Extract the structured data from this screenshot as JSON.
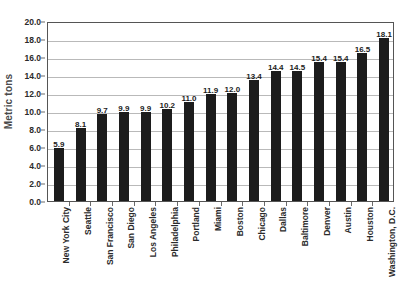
{
  "chart_data": {
    "type": "bar",
    "title": "",
    "xlabel": "",
    "ylabel": "Metric tons",
    "ylim": [
      0.0,
      20.0
    ],
    "ytick_step": 2.0,
    "ytick_labels": [
      "0.0",
      "2.0",
      "4.0",
      "6.0",
      "8.0",
      "10.0",
      "12.0",
      "14.0",
      "16.0",
      "18.0",
      "20.0"
    ],
    "grid": "horizontal",
    "legend": "none",
    "bar_color": "#1c1c1c",
    "gridline_color": "#b9b9b9",
    "axis_color": "#555555",
    "categories": [
      "New York City",
      "Seattle",
      "San Francisco",
      "San Diego",
      "Los Angeles",
      "Philadelphia",
      "Portland",
      "Miami",
      "Boston",
      "Chicago",
      "Dallas",
      "Baltimore",
      "Denver",
      "Austin",
      "Houston",
      "Washington, D.C."
    ],
    "values": [
      5.9,
      8.1,
      9.7,
      9.9,
      9.9,
      10.2,
      11.0,
      11.9,
      12.0,
      13.4,
      14.4,
      14.5,
      15.4,
      15.4,
      16.5,
      18.1
    ],
    "value_labels": [
      "5.9",
      "8.1",
      "9.7",
      "9.9",
      "9.9",
      "10.2",
      "11.0",
      "11.9",
      "12.0",
      "13.4",
      "14.4",
      "14.5",
      "15.4",
      "15.4",
      "16.5",
      "18.1"
    ]
  }
}
